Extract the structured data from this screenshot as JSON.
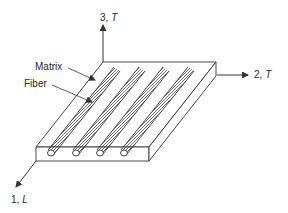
{
  "diagram": {
    "type": "composite-lamina-axes",
    "axes": [
      {
        "id": "axis-1",
        "number": "1",
        "symbol": "L",
        "label": "1, L",
        "direction": "down-left (fiber direction)"
      },
      {
        "id": "axis-2",
        "number": "2",
        "symbol": "T",
        "label": "2, T",
        "direction": "right"
      },
      {
        "id": "axis-3",
        "number": "3",
        "symbol": "T",
        "label": "3, T",
        "direction": "up"
      }
    ],
    "callouts": [
      {
        "id": "matrix",
        "label": "Matrix"
      },
      {
        "id": "fiber",
        "label": "Fiber"
      }
    ],
    "fiber_count": 4,
    "colors": {
      "line": "#333333",
      "background": "#ffffff"
    }
  },
  "labels": {
    "axis3_num": "3, ",
    "axis3_sym": "T",
    "axis2_num": "2, ",
    "axis2_sym": "T",
    "axis1_num": "1, ",
    "axis1_sym": "L",
    "matrix": "Matrix",
    "fiber": "Fiber"
  }
}
